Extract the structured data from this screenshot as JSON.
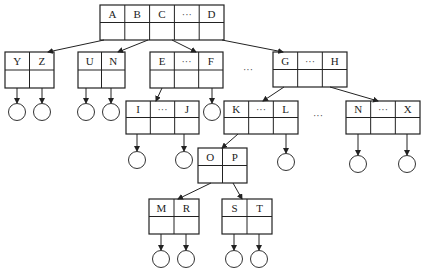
{
  "diagram": {
    "type": "tree",
    "nodes": [
      {
        "id": "root",
        "keys": [
          "A",
          "B",
          "C",
          "···",
          "D"
        ],
        "x": 100,
        "y": 5,
        "w": 124,
        "h": 35
      },
      {
        "id": "yz",
        "keys": [
          "Y",
          "Z"
        ],
        "x": 5,
        "y": 52,
        "w": 49,
        "h": 36
      },
      {
        "id": "un",
        "keys": [
          "U",
          "N"
        ],
        "x": 78,
        "y": 52,
        "w": 47,
        "h": 36
      },
      {
        "id": "ef",
        "keys": [
          "E",
          "···",
          "F"
        ],
        "x": 150,
        "y": 52,
        "w": 73,
        "h": 36
      },
      {
        "id": "gh",
        "keys": [
          "G",
          "···",
          "H"
        ],
        "x": 273,
        "y": 52,
        "w": 74,
        "h": 35
      },
      {
        "id": "ij",
        "keys": [
          "I",
          "···",
          "J"
        ],
        "x": 126,
        "y": 101,
        "w": 73,
        "h": 33
      },
      {
        "id": "kl",
        "keys": [
          "K",
          "···",
          "L"
        ],
        "x": 224,
        "y": 101,
        "w": 74,
        "h": 33
      },
      {
        "id": "nx",
        "keys": [
          "N",
          "···",
          "X"
        ],
        "x": 346,
        "y": 101,
        "w": 74,
        "h": 33
      },
      {
        "id": "op",
        "keys": [
          "O",
          "P"
        ],
        "x": 198,
        "y": 148,
        "w": 49,
        "h": 35
      },
      {
        "id": "mr",
        "keys": [
          "M",
          "R"
        ],
        "x": 149,
        "y": 199,
        "w": 50,
        "h": 35
      },
      {
        "id": "st",
        "keys": [
          "S",
          "T"
        ],
        "x": 222,
        "y": 199,
        "w": 50,
        "h": 35
      }
    ],
    "ellipses": [
      {
        "text": "···",
        "x": 248,
        "y": 73
      },
      {
        "text": "···",
        "x": 318,
        "y": 119
      }
    ],
    "leaf_count": 15
  }
}
